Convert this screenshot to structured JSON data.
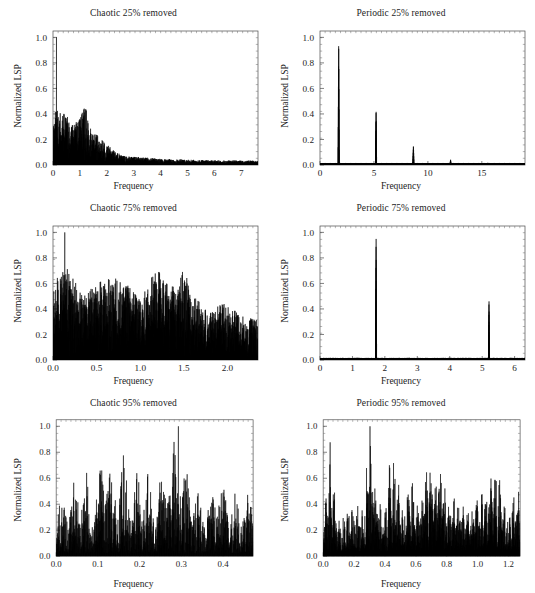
{
  "figure": {
    "background": "#ffffff",
    "line_color": "#050505",
    "axis_color": "#4a4a4a",
    "panel_count": 6,
    "shared_ylabel": "Normalized LSP",
    "shared_xlabel": "Frequency"
  },
  "chart_data": [
    {
      "id": "chaotic-25",
      "type": "line",
      "title": "Chaotic 25% removed",
      "xlabel": "Frequency",
      "ylabel": "Normalized LSP",
      "xlim": [
        0,
        7.62
      ],
      "ylim": [
        0,
        1.05
      ],
      "xticks": [
        0,
        1,
        2,
        3,
        4,
        5,
        6,
        7
      ],
      "xticklabels": [
        "0",
        "1",
        "2",
        "3",
        "4",
        "5",
        "6",
        "7"
      ],
      "yticks": [
        0.0,
        0.2,
        0.4,
        0.6,
        0.8,
        1.0
      ],
      "yticklabels": [
        "0.0",
        "0.2",
        "0.4",
        "0.6",
        "0.8",
        "1.0"
      ],
      "grid": false,
      "legend": false,
      "spectrum": {
        "kind": "noisy-decay",
        "n": 2600,
        "seed": 10711,
        "peak_x": 0.13,
        "peak_y": 1.0,
        "envelope": [
          {
            "x": 0.0,
            "y": 0.44
          },
          {
            "x": 0.25,
            "y": 0.42
          },
          {
            "x": 0.6,
            "y": 0.37
          },
          {
            "x": 0.9,
            "y": 0.34
          },
          {
            "x": 1.2,
            "y": 0.46
          },
          {
            "x": 1.5,
            "y": 0.26
          },
          {
            "x": 1.9,
            "y": 0.18
          },
          {
            "x": 2.3,
            "y": 0.1
          },
          {
            "x": 2.7,
            "y": 0.065
          },
          {
            "x": 3.1,
            "y": 0.06
          },
          {
            "x": 4.0,
            "y": 0.045
          },
          {
            "x": 5.0,
            "y": 0.038
          },
          {
            "x": 6.0,
            "y": 0.033
          },
          {
            "x": 7.62,
            "y": 0.03
          }
        ],
        "floor": 0.004,
        "roughness": 1.0
      }
    },
    {
      "id": "periodic-25",
      "type": "line",
      "title": "Periodic 25% removed",
      "xlabel": "Frequency",
      "ylabel": "Normalized LSP",
      "xlim": [
        0,
        19.0
      ],
      "ylim": [
        0,
        1.05
      ],
      "xticks": [
        0,
        5,
        10,
        15
      ],
      "xticklabels": [
        "0",
        "5",
        "10",
        "15"
      ],
      "yticks": [
        0.0,
        0.2,
        0.4,
        0.6,
        0.8,
        1.0
      ],
      "yticklabels": [
        "0.0",
        "0.2",
        "0.4",
        "0.6",
        "0.8",
        "1.0"
      ],
      "grid": false,
      "legend": false,
      "spectrum": {
        "kind": "spikes",
        "n": 2400,
        "seed": 4021,
        "baseline": 0.012,
        "baseline_jitter": 0.006,
        "peaks": [
          {
            "x": 1.73,
            "y": 1.0,
            "w": 0.05
          },
          {
            "x": 5.2,
            "y": 0.447,
            "w": 0.05
          },
          {
            "x": 8.66,
            "y": 0.156,
            "w": 0.05
          },
          {
            "x": 12.1,
            "y": 0.043,
            "w": 0.05
          },
          {
            "x": 15.55,
            "y": 0.018,
            "w": 0.05
          }
        ]
      }
    },
    {
      "id": "chaotic-75",
      "type": "line",
      "title": "Chaotic 75% removed",
      "xlabel": "Frequency",
      "ylabel": "Normalized LSP",
      "xlim": [
        0,
        2.35
      ],
      "ylim": [
        0,
        1.05
      ],
      "xticks": [
        0.0,
        0.5,
        1.0,
        1.5,
        2.0
      ],
      "xticklabels": [
        "0.0",
        "0.5",
        "1.0",
        "1.5",
        "2.0"
      ],
      "yticks": [
        0.0,
        0.2,
        0.4,
        0.6,
        0.8,
        1.0
      ],
      "yticklabels": [
        "0.0",
        "0.2",
        "0.4",
        "0.6",
        "0.8",
        "1.0"
      ],
      "grid": false,
      "legend": false,
      "spectrum": {
        "kind": "noisy-dense",
        "n": 2200,
        "seed": 88317,
        "peak_x": 0.135,
        "peak_y": 1.0,
        "envelope": [
          {
            "x": 0.0,
            "y": 0.6
          },
          {
            "x": 0.15,
            "y": 0.72
          },
          {
            "x": 0.35,
            "y": 0.5
          },
          {
            "x": 0.55,
            "y": 0.62
          },
          {
            "x": 0.78,
            "y": 0.64
          },
          {
            "x": 1.0,
            "y": 0.46
          },
          {
            "x": 1.18,
            "y": 0.72
          },
          {
            "x": 1.35,
            "y": 0.56
          },
          {
            "x": 1.5,
            "y": 0.7
          },
          {
            "x": 1.6,
            "y": 0.5
          },
          {
            "x": 1.8,
            "y": 0.36
          },
          {
            "x": 1.95,
            "y": 0.45
          },
          {
            "x": 2.15,
            "y": 0.34
          },
          {
            "x": 2.35,
            "y": 0.3
          }
        ],
        "floor": 0.01,
        "roughness": 1.0
      }
    },
    {
      "id": "periodic-75",
      "type": "line",
      "title": "Periodic 75% removed",
      "xlabel": "Frequency",
      "ylabel": "Normalized LSP",
      "xlim": [
        0,
        6.32
      ],
      "ylim": [
        0,
        1.05
      ],
      "xticks": [
        0,
        1,
        2,
        3,
        4,
        5,
        6
      ],
      "xticklabels": [
        "0",
        "1",
        "2",
        "3",
        "4",
        "5",
        "6"
      ],
      "yticks": [
        0.0,
        0.2,
        0.4,
        0.6,
        0.8,
        1.0
      ],
      "yticklabels": [
        "0.0",
        "0.2",
        "0.4",
        "0.6",
        "0.8",
        "1.0"
      ],
      "grid": false,
      "legend": false,
      "spectrum": {
        "kind": "spikes",
        "n": 2400,
        "seed": 3391,
        "baseline": 0.013,
        "baseline_jitter": 0.007,
        "peaks": [
          {
            "x": 1.73,
            "y": 1.0,
            "w": 0.016
          },
          {
            "x": 5.21,
            "y": 0.487,
            "w": 0.016
          }
        ]
      }
    },
    {
      "id": "chaotic-95",
      "type": "line",
      "title": "Chaotic 95% removed",
      "xlabel": "Frequency",
      "ylabel": "Normalized LSP",
      "xlim": [
        0,
        0.472
      ],
      "ylim": [
        0,
        1.05
      ],
      "xticks": [
        0.0,
        0.1,
        0.2,
        0.3,
        0.4
      ],
      "xticklabels": [
        "0.0",
        "0.1",
        "0.2",
        "0.3",
        "0.4"
      ],
      "yticks": [
        0.0,
        0.2,
        0.4,
        0.6,
        0.8,
        1.0
      ],
      "yticklabels": [
        "0.0",
        "0.2",
        "0.4",
        "0.6",
        "0.8",
        "1.0"
      ],
      "grid": false,
      "legend": false,
      "spectrum": {
        "kind": "sparse-spiky",
        "n": 900,
        "seed": 55109,
        "peak_x": 0.293,
        "peak_y": 1.0,
        "envelope": [
          {
            "x": 0.0,
            "y": 0.42
          },
          {
            "x": 0.035,
            "y": 0.52
          },
          {
            "x": 0.065,
            "y": 0.74
          },
          {
            "x": 0.09,
            "y": 0.4
          },
          {
            "x": 0.112,
            "y": 0.93
          },
          {
            "x": 0.135,
            "y": 0.6
          },
          {
            "x": 0.16,
            "y": 0.83
          },
          {
            "x": 0.185,
            "y": 0.5
          },
          {
            "x": 0.205,
            "y": 0.81
          },
          {
            "x": 0.235,
            "y": 0.44
          },
          {
            "x": 0.265,
            "y": 0.78
          },
          {
            "x": 0.295,
            "y": 1.0
          },
          {
            "x": 0.325,
            "y": 0.55
          },
          {
            "x": 0.355,
            "y": 0.44
          },
          {
            "x": 0.385,
            "y": 0.62
          },
          {
            "x": 0.41,
            "y": 0.52
          },
          {
            "x": 0.44,
            "y": 0.45
          },
          {
            "x": 0.472,
            "y": 0.48
          }
        ],
        "floor": 0.02,
        "roughness": 1.25
      }
    },
    {
      "id": "periodic-95",
      "type": "line",
      "title": "Periodic 95% removed",
      "xlabel": "Frequency",
      "ylabel": "Normalized LSP",
      "xlim": [
        0,
        1.275
      ],
      "ylim": [
        0,
        1.05
      ],
      "xticks": [
        0.0,
        0.2,
        0.4,
        0.6,
        0.8,
        1.0,
        1.2
      ],
      "xticklabels": [
        "0.0",
        "0.2",
        "0.4",
        "0.6",
        "0.8",
        "1.0",
        "1.2"
      ],
      "yticks": [
        0.0,
        0.2,
        0.4,
        0.6,
        0.8,
        1.0
      ],
      "yticklabels": [
        "0.0",
        "0.2",
        "0.4",
        "0.6",
        "0.8",
        "1.0"
      ],
      "grid": false,
      "legend": false,
      "spectrum": {
        "kind": "sparse-spiky",
        "n": 1300,
        "seed": 21467,
        "peak_x": 0.303,
        "peak_y": 1.0,
        "envelope": [
          {
            "x": 0.0,
            "y": 0.3
          },
          {
            "x": 0.045,
            "y": 0.89
          },
          {
            "x": 0.08,
            "y": 0.4
          },
          {
            "x": 0.13,
            "y": 0.33
          },
          {
            "x": 0.2,
            "y": 0.42
          },
          {
            "x": 0.26,
            "y": 0.38
          },
          {
            "x": 0.303,
            "y": 1.0
          },
          {
            "x": 0.34,
            "y": 0.56
          },
          {
            "x": 0.39,
            "y": 0.35
          },
          {
            "x": 0.45,
            "y": 0.93
          },
          {
            "x": 0.5,
            "y": 0.42
          },
          {
            "x": 0.56,
            "y": 0.6
          },
          {
            "x": 0.62,
            "y": 0.47
          },
          {
            "x": 0.67,
            "y": 0.66
          },
          {
            "x": 0.71,
            "y": 0.78
          },
          {
            "x": 0.755,
            "y": 0.92
          },
          {
            "x": 0.8,
            "y": 0.42
          },
          {
            "x": 0.86,
            "y": 0.48
          },
          {
            "x": 0.92,
            "y": 0.33
          },
          {
            "x": 1.0,
            "y": 0.43
          },
          {
            "x": 1.05,
            "y": 0.54
          },
          {
            "x": 1.12,
            "y": 0.77
          },
          {
            "x": 1.17,
            "y": 0.37
          },
          {
            "x": 1.23,
            "y": 0.45
          },
          {
            "x": 1.275,
            "y": 0.52
          }
        ],
        "floor": 0.03,
        "roughness": 1.2
      }
    }
  ]
}
